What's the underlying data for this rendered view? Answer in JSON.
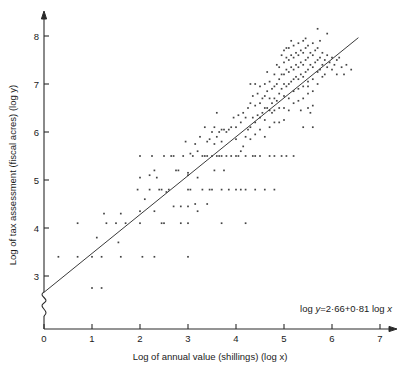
{
  "chart_data": {
    "type": "scatter",
    "title": "",
    "xlabel": "Log of annual value (shillings) (log x)",
    "ylabel": "Log of tax assessment (fiscal acres) (log y)",
    "xlim": [
      0,
      7
    ],
    "ylim": [
      2.55,
      8.3
    ],
    "xticks": [
      0,
      1,
      2,
      3,
      4,
      5,
      6,
      7
    ],
    "xtick_labels": [
      "0",
      "1",
      "2",
      "3",
      "4",
      "5",
      "6",
      "7"
    ],
    "yticks": [
      3,
      4,
      5,
      6,
      7,
      8
    ],
    "ytick_labels": [
      "3",
      "4",
      "5",
      "6",
      "7",
      "8"
    ],
    "grid": false,
    "legend": null,
    "y_axis_break": true,
    "y_axis_break_between": [
      0,
      3
    ],
    "annotation": "log y=2·66+0·81 log x",
    "annotation_parts": {
      "prefix": "log ",
      "var_y": "y",
      "middle": "=2·66+0·81 log ",
      "var_x": "x"
    },
    "fit_line": {
      "kind": "linear-regression",
      "intercept": 2.66,
      "slope": 0.81,
      "x_start": 0.0,
      "x_end": 6.55
    },
    "point_color": "#444444",
    "line_color": "#3a3a3a",
    "axis_color": "#2a2a2a",
    "n_points": 258,
    "points": [
      [
        0.3,
        3.4
      ],
      [
        0.7,
        3.4
      ],
      [
        0.7,
        4.1
      ],
      [
        1.0,
        3.4
      ],
      [
        1.0,
        2.75
      ],
      [
        1.1,
        3.8
      ],
      [
        1.2,
        3.4
      ],
      [
        1.2,
        2.75
      ],
      [
        1.25,
        4.3
      ],
      [
        1.3,
        4.1
      ],
      [
        1.5,
        4.1
      ],
      [
        1.55,
        3.7
      ],
      [
        1.6,
        4.3
      ],
      [
        1.6,
        3.4
      ],
      [
        1.95,
        4.8
      ],
      [
        2.0,
        5.05
      ],
      [
        2.0,
        4.35
      ],
      [
        2.0,
        5.5
      ],
      [
        2.05,
        3.4
      ],
      [
        2.1,
        4.6
      ],
      [
        2.2,
        5.1
      ],
      [
        2.25,
        5.5
      ],
      [
        2.3,
        5.2
      ],
      [
        2.3,
        4.35
      ],
      [
        2.3,
        3.4
      ],
      [
        2.35,
        5.05
      ],
      [
        2.4,
        4.8
      ],
      [
        2.45,
        4.8
      ],
      [
        2.5,
        5.5
      ],
      [
        2.5,
        4.1
      ],
      [
        2.55,
        4.75
      ],
      [
        2.6,
        4.8
      ],
      [
        2.65,
        5.5
      ],
      [
        2.7,
        5.5
      ],
      [
        2.75,
        5.2
      ],
      [
        2.8,
        5.2
      ],
      [
        2.85,
        4.45
      ],
      [
        2.9,
        5.5
      ],
      [
        2.95,
        5.8
      ],
      [
        3.0,
        5.1
      ],
      [
        3.0,
        5.15
      ],
      [
        3.0,
        4.8
      ],
      [
        3.0,
        4.45
      ],
      [
        3.0,
        4.1
      ],
      [
        3.0,
        3.4
      ],
      [
        3.05,
        5.55
      ],
      [
        3.1,
        5.5
      ],
      [
        3.15,
        5.75
      ],
      [
        3.2,
        5.6
      ],
      [
        3.2,
        5.05
      ],
      [
        3.25,
        5.9
      ],
      [
        3.3,
        5.5
      ],
      [
        3.3,
        4.8
      ],
      [
        3.35,
        6.1
      ],
      [
        3.4,
        5.8
      ],
      [
        3.4,
        5.5
      ],
      [
        3.4,
        4.5
      ],
      [
        3.45,
        5.85
      ],
      [
        3.5,
        6.0
      ],
      [
        3.5,
        5.5
      ],
      [
        3.5,
        4.8
      ],
      [
        3.55,
        6.1
      ],
      [
        3.55,
        5.75
      ],
      [
        3.6,
        6.4
      ],
      [
        3.6,
        5.9
      ],
      [
        3.6,
        5.5
      ],
      [
        3.65,
        6.0
      ],
      [
        3.65,
        5.5
      ],
      [
        3.7,
        6.05
      ],
      [
        3.7,
        5.8
      ],
      [
        3.7,
        5.5
      ],
      [
        3.7,
        4.8
      ],
      [
        3.7,
        4.1
      ],
      [
        3.75,
        6.05
      ],
      [
        3.8,
        6.0
      ],
      [
        3.8,
        5.5
      ],
      [
        3.85,
        6.05
      ],
      [
        3.9,
        6.1
      ],
      [
        3.9,
        5.5
      ],
      [
        3.95,
        6.3
      ],
      [
        4.0,
        6.1
      ],
      [
        4.0,
        5.85
      ],
      [
        4.0,
        5.5
      ],
      [
        4.0,
        4.8
      ],
      [
        4.05,
        6.35
      ],
      [
        4.1,
        6.2
      ],
      [
        4.1,
        5.6
      ],
      [
        4.1,
        4.8
      ],
      [
        4.15,
        6.4
      ],
      [
        4.15,
        5.7
      ],
      [
        4.2,
        6.3
      ],
      [
        4.2,
        5.9
      ],
      [
        4.2,
        5.5
      ],
      [
        4.2,
        4.8
      ],
      [
        4.2,
        4.1
      ],
      [
        4.25,
        6.5
      ],
      [
        4.25,
        6.05
      ],
      [
        4.3,
        7.0
      ],
      [
        4.3,
        6.6
      ],
      [
        4.3,
        6.1
      ],
      [
        4.3,
        5.85
      ],
      [
        4.35,
        6.75
      ],
      [
        4.35,
        6.3
      ],
      [
        4.4,
        7.0
      ],
      [
        4.4,
        6.55
      ],
      [
        4.4,
        6.2
      ],
      [
        4.4,
        5.95
      ],
      [
        4.4,
        5.5
      ],
      [
        4.45,
        6.8
      ],
      [
        4.45,
        6.35
      ],
      [
        4.5,
        6.95
      ],
      [
        4.5,
        6.6
      ],
      [
        4.5,
        6.3
      ],
      [
        4.5,
        6.05
      ],
      [
        4.5,
        5.5
      ],
      [
        4.55,
        6.7
      ],
      [
        4.55,
        6.4
      ],
      [
        4.6,
        7.0
      ],
      [
        4.6,
        6.75
      ],
      [
        4.6,
        6.5
      ],
      [
        4.6,
        6.25
      ],
      [
        4.6,
        5.9
      ],
      [
        4.6,
        4.8
      ],
      [
        4.65,
        6.85
      ],
      [
        4.65,
        6.5
      ],
      [
        4.7,
        7.05
      ],
      [
        4.7,
        6.7
      ],
      [
        4.7,
        6.45
      ],
      [
        4.7,
        6.1
      ],
      [
        4.7,
        5.5
      ],
      [
        4.75,
        6.9
      ],
      [
        4.75,
        6.6
      ],
      [
        4.8,
        7.2
      ],
      [
        4.8,
        6.95
      ],
      [
        4.8,
        6.7
      ],
      [
        4.8,
        6.45
      ],
      [
        4.8,
        6.2
      ],
      [
        4.8,
        5.5
      ],
      [
        4.8,
        4.8
      ],
      [
        4.85,
        7.0
      ],
      [
        4.85,
        6.65
      ],
      [
        4.9,
        7.35
      ],
      [
        4.9,
        7.1
      ],
      [
        4.9,
        6.8
      ],
      [
        4.9,
        6.5
      ],
      [
        4.9,
        6.2
      ],
      [
        4.95,
        7.2
      ],
      [
        4.95,
        6.9
      ],
      [
        5.0,
        7.7
      ],
      [
        5.0,
        7.45
      ],
      [
        5.0,
        7.2
      ],
      [
        5.0,
        7.0
      ],
      [
        5.0,
        6.75
      ],
      [
        5.0,
        6.5
      ],
      [
        5.0,
        6.25
      ],
      [
        5.05,
        7.55
      ],
      [
        5.05,
        7.3
      ],
      [
        5.05,
        6.95
      ],
      [
        5.1,
        7.75
      ],
      [
        5.1,
        7.5
      ],
      [
        5.1,
        7.25
      ],
      [
        5.1,
        7.0
      ],
      [
        5.1,
        6.7
      ],
      [
        5.1,
        6.45
      ],
      [
        5.15,
        7.6
      ],
      [
        5.15,
        7.35
      ],
      [
        5.15,
        7.05
      ],
      [
        5.2,
        7.8
      ],
      [
        5.2,
        7.55
      ],
      [
        5.2,
        7.3
      ],
      [
        5.2,
        7.1
      ],
      [
        5.2,
        6.85
      ],
      [
        5.2,
        6.6
      ],
      [
        5.25,
        7.65
      ],
      [
        5.25,
        7.4
      ],
      [
        5.25,
        7.15
      ],
      [
        5.3,
        7.85
      ],
      [
        5.3,
        7.6
      ],
      [
        5.3,
        7.35
      ],
      [
        5.3,
        7.1
      ],
      [
        5.3,
        6.9
      ],
      [
        5.3,
        6.65
      ],
      [
        5.35,
        7.7
      ],
      [
        5.35,
        7.45
      ],
      [
        5.35,
        7.2
      ],
      [
        5.4,
        7.9
      ],
      [
        5.4,
        7.65
      ],
      [
        5.4,
        7.4
      ],
      [
        5.4,
        7.15
      ],
      [
        5.4,
        6.95
      ],
      [
        5.4,
        6.7
      ],
      [
        5.4,
        6.1
      ],
      [
        5.45,
        7.75
      ],
      [
        5.45,
        7.5
      ],
      [
        5.45,
        7.25
      ],
      [
        5.5,
        7.8
      ],
      [
        5.5,
        7.55
      ],
      [
        5.5,
        7.3
      ],
      [
        5.5,
        7.05
      ],
      [
        5.5,
        6.8
      ],
      [
        5.5,
        6.5
      ],
      [
        5.55,
        7.65
      ],
      [
        5.55,
        7.4
      ],
      [
        5.6,
        7.85
      ],
      [
        5.6,
        7.6
      ],
      [
        5.6,
        7.35
      ],
      [
        5.6,
        7.1
      ],
      [
        5.6,
        6.85
      ],
      [
        5.6,
        6.1
      ],
      [
        5.65,
        7.7
      ],
      [
        5.65,
        7.45
      ],
      [
        5.7,
        8.15
      ],
      [
        5.7,
        7.75
      ],
      [
        5.7,
        7.5
      ],
      [
        5.7,
        7.25
      ],
      [
        5.7,
        7.0
      ],
      [
        5.75,
        7.55
      ],
      [
        5.75,
        7.3
      ],
      [
        5.8,
        7.65
      ],
      [
        5.8,
        7.4
      ],
      [
        5.8,
        7.15
      ],
      [
        5.85,
        7.5
      ],
      [
        5.9,
        8.05
      ],
      [
        5.9,
        7.6
      ],
      [
        5.9,
        7.35
      ],
      [
        5.95,
        7.45
      ],
      [
        6.0,
        7.55
      ],
      [
        6.0,
        7.3
      ],
      [
        6.05,
        7.4
      ],
      [
        6.1,
        7.5
      ],
      [
        6.1,
        7.2
      ],
      [
        6.2,
        7.35
      ],
      [
        6.25,
        7.2
      ],
      [
        6.3,
        7.4
      ],
      [
        6.4,
        7.3
      ],
      [
        5.2,
        5.5
      ],
      [
        5.05,
        5.5
      ],
      [
        4.95,
        5.5
      ],
      [
        4.4,
        4.8
      ],
      [
        3.85,
        4.8
      ],
      [
        3.45,
        4.8
      ],
      [
        3.2,
        4.35
      ],
      [
        2.85,
        4.1
      ],
      [
        2.45,
        4.1
      ],
      [
        4.75,
        6.4
      ],
      [
        5.55,
        6.4
      ],
      [
        3.35,
        5.5
      ],
      [
        4.05,
        5.5
      ],
      [
        2.7,
        4.45
      ],
      [
        5.5,
        6.95
      ],
      [
        5.85,
        7.2
      ],
      [
        4.95,
        7.6
      ],
      [
        5.05,
        7.75
      ],
      [
        4.85,
        7.4
      ],
      [
        3.05,
        4.8
      ],
      [
        3.55,
        5.2
      ],
      [
        2.2,
        4.8
      ],
      [
        2.0,
        4.1
      ],
      [
        1.7,
        4.1
      ],
      [
        5.35,
        6.45
      ],
      [
        5.6,
        6.55
      ],
      [
        4.35,
        5.5
      ],
      [
        3.75,
        5.2
      ],
      [
        3.15,
        4.5
      ],
      [
        6.15,
        7.55
      ],
      [
        5.75,
        7.9
      ],
      [
        5.45,
        7.95
      ],
      [
        5.15,
        7.9
      ],
      [
        4.65,
        7.25
      ]
    ]
  }
}
